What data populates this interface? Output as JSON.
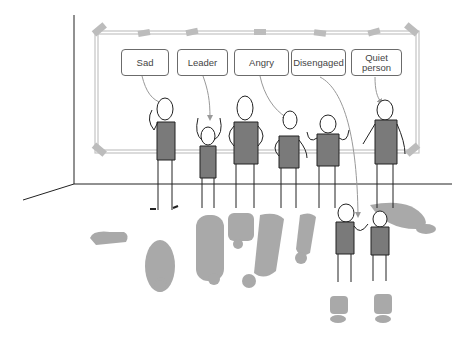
{
  "scene": {
    "description": "Team dynamics illustration: five people stand in front of a whiteboard, each with a label pointing to them, with gray shadows/reflections on the floor",
    "colors": {
      "body_fill": "#7a7a7a",
      "shadow_fill": "#a8a8a8",
      "board_frame": "#bdbdbd",
      "line": "#222222"
    }
  },
  "labels": [
    {
      "id": "sad",
      "text": "Sad"
    },
    {
      "id": "leader",
      "text": "Leader"
    },
    {
      "id": "angry",
      "text": "Angry"
    },
    {
      "id": "disengaged",
      "text": "Disengaged"
    },
    {
      "id": "quiet",
      "text": "Quiet person"
    }
  ],
  "figures": [
    {
      "role": "sad",
      "pose": "hand raised"
    },
    {
      "role": "leader",
      "pose": "both arms raised"
    },
    {
      "role": "tall",
      "pose": "hands on hips"
    },
    {
      "role": "angry",
      "pose": "hands on hips"
    },
    {
      "role": "shrugging",
      "pose": "arms up shrug"
    },
    {
      "role": "quiet",
      "pose": "hand to mouth"
    },
    {
      "role": "disengaged",
      "pose": "talking, in foreground"
    },
    {
      "role": "listener",
      "pose": "hands on hips, in foreground"
    }
  ]
}
